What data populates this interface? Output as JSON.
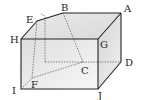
{
  "diagram": {
    "type": "geometry-solid",
    "labels": {
      "A": "A",
      "B": "B",
      "C": "C",
      "D": "D",
      "E": "E",
      "F": "F",
      "G": "G",
      "H": "H",
      "I": "I",
      "J": "J"
    },
    "colors": {
      "edge": "#222222",
      "hidden_edge": "#555555",
      "face_top": "#e4e4e4",
      "face_front": "#f0f0f0",
      "face_side": "#dcdcdc"
    }
  }
}
